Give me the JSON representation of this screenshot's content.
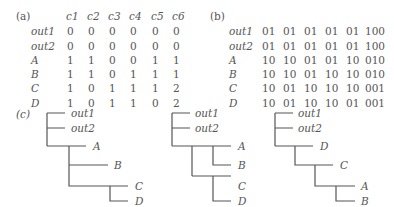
{
  "panel_a": {
    "label": "(a)",
    "columns": [
      "c1",
      "c2",
      "c3",
      "c4",
      "c5",
      "c6"
    ],
    "rows": [
      {
        "name": "out1",
        "values": [
          "0",
          "0",
          "0",
          "0",
          "0",
          "0"
        ]
      },
      {
        "name": "out2",
        "values": [
          "0",
          "0",
          "0",
          "0",
          "0",
          "0"
        ]
      },
      {
        "name": "A",
        "values": [
          "1",
          "1",
          "0",
          "0",
          "1",
          "1"
        ]
      },
      {
        "name": "B",
        "values": [
          "1",
          "1",
          "0",
          "1",
          "1",
          "1"
        ]
      },
      {
        "name": "C",
        "values": [
          "1",
          "0",
          "1",
          "1",
          "1",
          "2"
        ]
      },
      {
        "name": "D",
        "values": [
          "1",
          "0",
          "1",
          "1",
          "0",
          "2"
        ]
      }
    ]
  },
  "panel_b": {
    "label": "(b)",
    "rows": [
      {
        "name": "out1",
        "values": [
          "01",
          "01",
          "01",
          "01",
          "01",
          "100"
        ]
      },
      {
        "name": "out2",
        "values": [
          "01",
          "01",
          "01",
          "01",
          "01",
          "100"
        ]
      },
      {
        "name": "A",
        "values": [
          "10",
          "10",
          "01",
          "01",
          "10",
          "010"
        ]
      },
      {
        "name": "B",
        "values": [
          "10",
          "10",
          "01",
          "10",
          "10",
          "010"
        ]
      },
      {
        "name": "C",
        "values": [
          "10",
          "01",
          "10",
          "10",
          "10",
          "001"
        ]
      },
      {
        "name": "D",
        "values": [
          "10",
          "01",
          "10",
          "10",
          "01",
          "001"
        ]
      }
    ]
  },
  "panel_c": {
    "label": "(c)",
    "trees": [
      {
        "leaves": [
          "out1",
          "out2",
          "A",
          "B",
          "C",
          "D"
        ]
      },
      {
        "leaves": [
          "out1",
          "out2",
          "A",
          "B",
          "C",
          "D"
        ]
      },
      {
        "leaves": [
          "out1",
          "out2",
          "D",
          "C",
          "A",
          "B"
        ]
      }
    ]
  }
}
